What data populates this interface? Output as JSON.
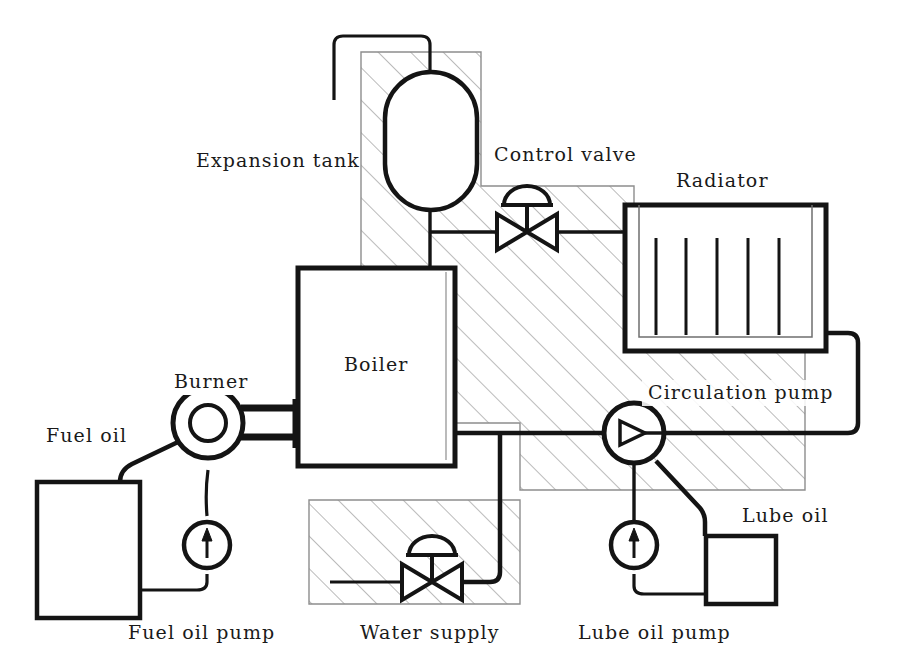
{
  "diagram": {
    "canvas": {
      "width": 918,
      "height": 667,
      "background": "#ffffff"
    },
    "style": {
      "line_color": "#141414",
      "hatch_color": "#8d8d8d",
      "hatch_angle_deg": 45,
      "hatch_spacing_px": 23,
      "pipe_stroke_width": 4.5,
      "thin_stroke_width": 1.6
    },
    "labels": [
      {
        "id": "expansion-tank",
        "text": "Expansion tank",
        "x": 196,
        "y": 166,
        "anchor": "start"
      },
      {
        "id": "control-valve",
        "text": "Control valve",
        "x": 494,
        "y": 160,
        "anchor": "start"
      },
      {
        "id": "radiator",
        "text": "Radiator",
        "x": 676,
        "y": 186,
        "anchor": "start"
      },
      {
        "id": "boiler",
        "text": "Boiler",
        "x": 344,
        "y": 370,
        "anchor": "start"
      },
      {
        "id": "burner",
        "text": "Burner",
        "x": 174,
        "y": 387,
        "anchor": "start"
      },
      {
        "id": "fuel-oil",
        "text": "Fuel oil",
        "x": 46,
        "y": 441,
        "anchor": "start"
      },
      {
        "id": "circulation-pump",
        "text": "Circulation pump",
        "x": 648,
        "y": 398,
        "anchor": "start"
      },
      {
        "id": "lube-oil",
        "text": "Lube oil",
        "x": 742,
        "y": 521,
        "anchor": "start"
      },
      {
        "id": "fuel-oil-pump",
        "text": "Fuel oil pump",
        "x": 128,
        "y": 638,
        "anchor": "start"
      },
      {
        "id": "water-supply",
        "text": "Water supply",
        "x": 360,
        "y": 638,
        "anchor": "start"
      },
      {
        "id": "lube-oil-pump",
        "text": "Lube oil pump",
        "x": 578,
        "y": 638,
        "anchor": "start"
      }
    ],
    "components": [
      {
        "id": "expansion-tank",
        "type": "vessel",
        "shape": "rounded-oval"
      },
      {
        "id": "control-valve",
        "type": "valve",
        "shape": "globe-valve-with-dome-actuator"
      },
      {
        "id": "radiator",
        "type": "radiator",
        "tube_count": 5
      },
      {
        "id": "boiler",
        "type": "boiler",
        "shape": "rectangle"
      },
      {
        "id": "burner",
        "type": "burner",
        "shape": "double-circle-with-nozzle"
      },
      {
        "id": "fuel-oil-tank",
        "type": "tank",
        "shape": "rectangle"
      },
      {
        "id": "fuel-oil-pump",
        "type": "pump",
        "shape": "circle-with-up-arrow"
      },
      {
        "id": "water-supply-valve",
        "type": "valve",
        "shape": "globe-valve-with-dome-actuator"
      },
      {
        "id": "circulation-pump",
        "type": "pump",
        "shape": "circle-with-right-triangle"
      },
      {
        "id": "lube-oil-pump",
        "type": "pump",
        "shape": "circle-with-up-arrow"
      },
      {
        "id": "lube-oil-tank",
        "type": "tank",
        "shape": "rectangle"
      }
    ]
  }
}
